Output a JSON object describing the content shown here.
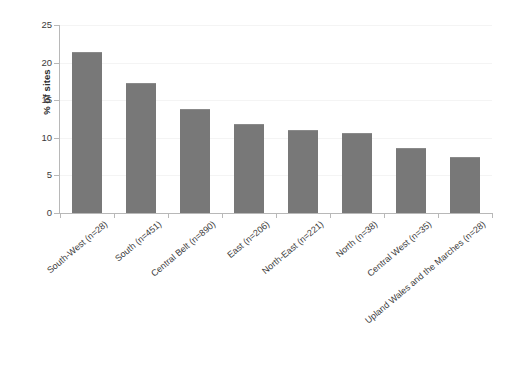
{
  "chart_data": {
    "type": "bar",
    "title": "",
    "subtitle": "",
    "xlabel": "",
    "ylabel": "% of sites",
    "ylim": [
      0,
      25
    ],
    "ytick_step": 5,
    "yticks": [
      0,
      5,
      10,
      15,
      20,
      25
    ],
    "ytick_labels": [
      "0",
      "5",
      "10",
      "15",
      "20",
      "25"
    ],
    "grid": true,
    "grid_axis": "y",
    "legend": false,
    "legend_position": "none",
    "bar_color": "#787878",
    "axis_color": "#b8b8b8",
    "gridline_color": "#f4f4f4",
    "categories": [
      "South-West (n=28)",
      "South (n=451)",
      "Central Belt (n=890)",
      "East (n=206)",
      "North-East (n=221)",
      "North (n=38)",
      "Central West (n=35)",
      "Upland Wales and the Marches (n=28)"
    ],
    "values": [
      21.4,
      17.3,
      13.8,
      11.8,
      11.0,
      10.7,
      8.7,
      7.4
    ]
  }
}
